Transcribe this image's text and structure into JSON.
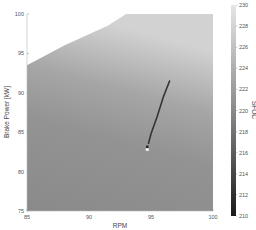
{
  "chart_data": {
    "type": "heatmap",
    "title": "",
    "xlabel": "RPM",
    "ylabel": "Brake Power [kW]",
    "colorbar_label": "SFOC",
    "xlim": [
      85,
      100
    ],
    "ylim": [
      75,
      100
    ],
    "x_ticks": [
      85,
      90,
      95,
      100
    ],
    "y_ticks": [
      75,
      80,
      85,
      90,
      95,
      100
    ],
    "colorbar_ticks": [
      210,
      212,
      214,
      216,
      218,
      220,
      222,
      224,
      226,
      228,
      230
    ],
    "colorbar_range": [
      210,
      230
    ],
    "colormap": "gray",
    "grid": false,
    "valid_region_boundary": [
      {
        "rpm": 85.0,
        "power": 93.5
      },
      {
        "rpm": 88.0,
        "power": 96.0
      },
      {
        "rpm": 91.5,
        "power": 98.5
      },
      {
        "rpm": 93.0,
        "power": 100.0
      },
      {
        "rpm": 100.0,
        "power": 100.0
      }
    ],
    "sfoc_gradient": [
      {
        "power": 75,
        "sfoc": 218
      },
      {
        "power": 85,
        "sfoc": 219
      },
      {
        "power": 90,
        "sfoc": 221
      },
      {
        "power": 95,
        "sfoc": 225
      },
      {
        "power": 100,
        "sfoc": 229
      }
    ],
    "trajectory": {
      "name": "operating trajectory",
      "color": "#333333",
      "points": [
        {
          "rpm": 96.5,
          "power": 91.5
        },
        {
          "rpm": 96.0,
          "power": 89.5
        },
        {
          "rpm": 95.5,
          "power": 87.0
        },
        {
          "rpm": 95.0,
          "power": 84.8
        },
        {
          "rpm": 94.8,
          "power": 83.6
        }
      ],
      "end_marker": {
        "rpm": 94.7,
        "power": 82.8,
        "color": "#ffffff"
      }
    }
  }
}
